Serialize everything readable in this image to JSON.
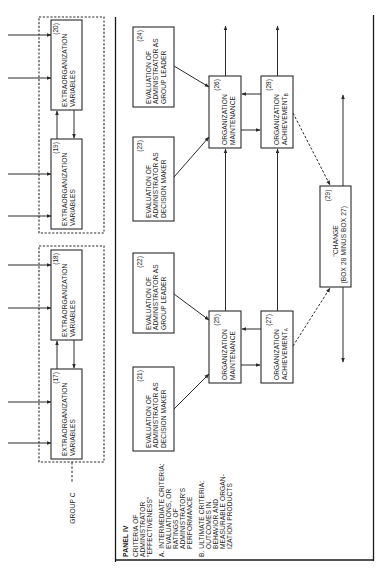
{
  "panel": {
    "title": "PANEL IV",
    "subtitle_lines": [
      "CRITERIA OF",
      "ADMINISTRATOR",
      "\"EFFECTIVENESS\""
    ],
    "criteria_a_lines": [
      "A.  INTERMEDIATE CRITERIA:",
      "EVALUATIONS, OR",
      "RATINGS OF",
      "ADMINISTRATOR'S",
      "PERFORMANCE"
    ],
    "criteria_b_lines": [
      "B.  ULTIMATE CRITERIA:",
      "OUTCOMES IN",
      "BEHAVIOR AND",
      "MEASURABLE ORGAN-",
      "IZATION PRODUCTS"
    ]
  },
  "group_label": "GROUP C",
  "boxes": {
    "b17": {
      "num": "(17)",
      "l1": "EXTRAORGANIZATION",
      "l2": "VARIABLES"
    },
    "b18": {
      "num": "(18)",
      "l1": "EXTRAORGANIZATION",
      "l2": "VARIABLES"
    },
    "b19": {
      "num": "(19)",
      "l1": "EXTRAORGANIZATION",
      "l2": "VARIABLES"
    },
    "b20": {
      "num": "(20)",
      "l1": "EXTRAORGANIZATION",
      "l2": "VARIABLES"
    },
    "b21": {
      "num": "(21)",
      "l1": "EVALUATION OF",
      "l2": "ADMINISTRATOR AS",
      "l3": "DECISION MAKER"
    },
    "b22": {
      "num": "(22)",
      "l1": "EVALUATION OF",
      "l2": "ADMINISTRATOR AS",
      "l3": "GROUP LEADER"
    },
    "b23": {
      "num": "(23)",
      "l1": "EVALUATION OF",
      "l2": "ADMINISTRATOR AS",
      "l3": "DECISION MAKER"
    },
    "b24": {
      "num": "(24)",
      "l1": "EVALUATION OF",
      "l2": "ADMINISTRATOR AS",
      "l3": "GROUP LEADER"
    },
    "b25": {
      "num": "(25)",
      "l1": "ORGANIZATION",
      "l2": "MAINTENANCE"
    },
    "b26": {
      "num": "(26)",
      "l1": "ORGANIZATION",
      "l2": "MAINTENANCE"
    },
    "b27": {
      "num": "(27)",
      "l1": "ORGANIZATION",
      "l2": "ACHIEVEMENT",
      "sub": "A"
    },
    "b28": {
      "num": "(28)",
      "l1": "ORGANIZATION",
      "l2": "ACHIEVEMENT",
      "sub": "B"
    },
    "b29": {
      "num": "(29)",
      "l1": "\"CHANGE",
      "l2": "(BOX 28 MINUS BOX 27)"
    }
  }
}
